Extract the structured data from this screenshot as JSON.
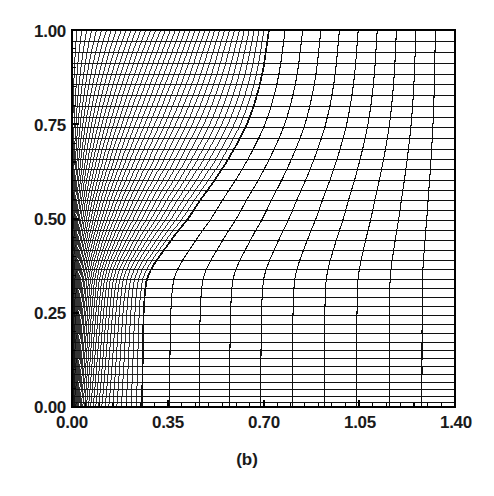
{
  "figure": {
    "caption": "(b)",
    "background_color": "#ffffff",
    "line_color": "#101010",
    "frame_color": "#000000"
  },
  "axes": {
    "x_ticks": [
      "0.00",
      "0.35",
      "0.70",
      "1.05",
      "1.40"
    ],
    "y_ticks": [
      "1.00",
      "0.75",
      "0.50",
      "0.25",
      "0.00"
    ],
    "x_label": "",
    "y_label": ""
  },
  "chart_data": {
    "type": "line",
    "title": "(b)",
    "xlabel": "",
    "ylabel": "",
    "xlim": [
      0.0,
      1.4
    ],
    "ylim": [
      0.0,
      1.0
    ],
    "xticks": [
      0.0,
      0.35,
      0.7,
      1.05,
      1.4
    ],
    "yticks": [
      0.0,
      0.25,
      0.5,
      0.75,
      1.0
    ],
    "xticklabels": [
      "0.00",
      "0.35",
      "0.70",
      "1.05",
      "1.40"
    ],
    "yticklabels": [
      "0.00",
      "0.25",
      "0.50",
      "0.75",
      "1.00"
    ],
    "grid": false,
    "legend": null,
    "blocks": [
      {
        "name": "fine-clustered-block",
        "region": "left",
        "columns": 40,
        "rows": 40,
        "x_range": [
          0.0,
          0.72
        ],
        "y_range": [
          0.0,
          1.0
        ],
        "clustering": "strong x-clustering toward x=0 at low y; nearly uniform at high y"
      },
      {
        "name": "coarse-block",
        "region": "right",
        "columns": 10,
        "rows": 40,
        "x_range": [
          0.25,
          1.4
        ],
        "y_range": [
          0.0,
          1.0
        ],
        "clustering": "near uniform, skewed near interface"
      }
    ],
    "interface_curve": {
      "name": "block-interface",
      "points_xy": [
        [
          0.72,
          1.0
        ],
        [
          0.71,
          0.95
        ],
        [
          0.7,
          0.9
        ],
        [
          0.685,
          0.85
        ],
        [
          0.665,
          0.8
        ],
        [
          0.64,
          0.75
        ],
        [
          0.605,
          0.7
        ],
        [
          0.565,
          0.65
        ],
        [
          0.52,
          0.6
        ],
        [
          0.47,
          0.55
        ],
        [
          0.425,
          0.5
        ],
        [
          0.38,
          0.46
        ],
        [
          0.34,
          0.42
        ],
        [
          0.305,
          0.385
        ],
        [
          0.285,
          0.36
        ],
        [
          0.272,
          0.335
        ],
        [
          0.266,
          0.3
        ],
        [
          0.262,
          0.25
        ],
        [
          0.26,
          0.2
        ],
        [
          0.259,
          0.15
        ],
        [
          0.258,
          0.1
        ],
        [
          0.257,
          0.05
        ],
        [
          0.257,
          0.0
        ]
      ]
    }
  }
}
